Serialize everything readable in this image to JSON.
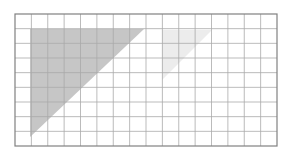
{
  "figure": {
    "background_color": "#ffffff",
    "grid": {
      "x": 15,
      "y": 14,
      "width": 262,
      "height": 132,
      "columns": 16,
      "rows": 9,
      "cell_width": 16.375,
      "cell_height": 14.667,
      "line_color": "#a9a9a9",
      "line_width": 0.8,
      "border_color": "#808080",
      "border_width": 1.2,
      "fill_color": "#ffffff"
    },
    "shapes": [
      {
        "name": "large-shaded-triangle",
        "type": "right-triangle",
        "fill_color": "#c6c6c6",
        "points": "30,29 144,29 30,137",
        "vertices": [
          [
            30,
            29
          ],
          [
            144,
            29
          ],
          [
            30,
            137
          ]
        ],
        "right_angle_at": [
          30,
          29
        ],
        "leg_columns": 7,
        "leg_rows": 7
      },
      {
        "name": "small-shaded-triangle",
        "type": "right-triangle",
        "fill_color": "#ececec",
        "points": "162,30 212,30 162,80",
        "vertices": [
          [
            162,
            30
          ],
          [
            212,
            30
          ],
          [
            162,
            80
          ]
        ],
        "right_angle_at": [
          162,
          30
        ],
        "leg_columns": 3,
        "leg_rows": 3
      }
    ]
  },
  "chart_data": {
    "type": "diagram",
    "title": "",
    "xlabel": "",
    "ylabel": "",
    "grid": true,
    "grid_columns": 16,
    "grid_rows": 9,
    "legend": [],
    "annotations": [],
    "series": [
      {
        "name": "large-shaded-triangle",
        "shape": "right triangle",
        "fill": "#c6c6c6",
        "grid_vertices": [
          [
            1,
            1
          ],
          [
            8,
            1
          ],
          [
            1,
            8
          ]
        ],
        "base_units": 7,
        "height_units": 7,
        "area_units": 24.5
      },
      {
        "name": "small-shaded-triangle",
        "shape": "right triangle",
        "fill": "#ececec",
        "grid_vertices": [
          [
            9,
            1
          ],
          [
            12,
            1
          ],
          [
            9,
            4
          ]
        ],
        "base_units": 3,
        "height_units": 3,
        "area_units": 4.5
      }
    ]
  }
}
